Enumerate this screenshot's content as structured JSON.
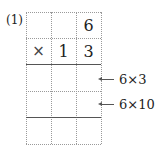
{
  "problem": {
    "label": "(1)",
    "rows": [
      [
        "",
        "",
        "6"
      ],
      [
        "×",
        "1",
        "3"
      ],
      [
        "",
        "",
        ""
      ],
      [
        "",
        "",
        ""
      ],
      [
        "",
        "",
        ""
      ]
    ],
    "annotations": [
      {
        "text": "6×3",
        "row": 2
      },
      {
        "text": "6×10",
        "row": 3
      }
    ]
  }
}
